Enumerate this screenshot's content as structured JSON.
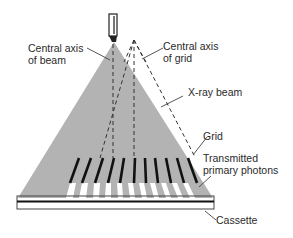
{
  "labels": {
    "central_axis_beam": [
      "Central axis",
      "of beam"
    ],
    "central_axis_grid": [
      "Central axis",
      "of grid"
    ],
    "xray_beam": "X-ray beam",
    "grid": "Grid",
    "transmitted": [
      "Transmitted",
      "primary photons"
    ],
    "cassette": "Cassette"
  },
  "colors": {
    "beam": "#b3b3b3",
    "grid_strip": "#111111",
    "leader": "#444444",
    "dash": "#333333"
  }
}
